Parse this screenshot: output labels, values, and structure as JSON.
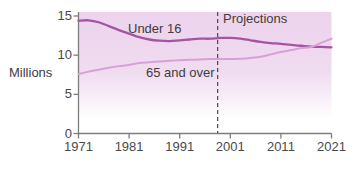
{
  "chart_data": {
    "type": "line",
    "title": "",
    "xlabel": "",
    "ylabel": "Millions",
    "ylim": [
      0,
      15
    ],
    "xlim": [
      1971,
      2021
    ],
    "x_ticks": [
      1971,
      1981,
      1991,
      2001,
      2011,
      2021
    ],
    "y_ticks": [
      0,
      5,
      10,
      15
    ],
    "grid": false,
    "legend_position": "inline-annotations",
    "projections_label": "Projections",
    "projections_start_year": 1998.5,
    "x": [
      1971,
      1973,
      1975,
      1977,
      1979,
      1981,
      1983,
      1985,
      1987,
      1989,
      1991,
      1993,
      1995,
      1997,
      1999,
      2001,
      2003,
      2005,
      2007,
      2009,
      2011,
      2013,
      2015,
      2017,
      2019,
      2021
    ],
    "series": [
      {
        "name": "Under 16",
        "color": "#a653a3",
        "values": [
          14.4,
          14.45,
          14.2,
          13.7,
          13.2,
          12.75,
          12.3,
          12.0,
          11.85,
          11.8,
          11.9,
          12.0,
          12.1,
          12.1,
          12.2,
          12.2,
          12.1,
          11.9,
          11.7,
          11.55,
          11.45,
          11.3,
          11.2,
          11.1,
          11.05,
          11.0
        ]
      },
      {
        "name": "65 and over",
        "color": "#d7a0d6",
        "values": [
          7.6,
          7.9,
          8.15,
          8.4,
          8.6,
          8.75,
          9.0,
          9.1,
          9.2,
          9.3,
          9.35,
          9.4,
          9.45,
          9.5,
          9.5,
          9.5,
          9.55,
          9.65,
          9.8,
          10.1,
          10.4,
          10.65,
          10.9,
          11.05,
          11.6,
          12.1
        ]
      }
    ],
    "background_gradient": {
      "stops": [
        [
          0,
          "#edd3ed"
        ],
        [
          0.5,
          "#f0dcf0"
        ],
        [
          0.88,
          "#ffffff"
        ]
      ]
    },
    "axis_color": "#7d7d7d",
    "projection_line_color": "#4a4a4a"
  }
}
